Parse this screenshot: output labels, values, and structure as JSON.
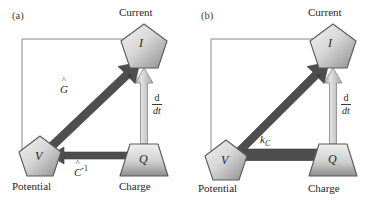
{
  "figure": {
    "type": "diagram",
    "background": "#ffffff",
    "node_fill_light": "#e8e8e8",
    "node_fill_dark": "#9a9a9a",
    "node_stroke": "#555555",
    "arrow_dark": "#4a4a4a",
    "arrow_light": "#bdbdbd",
    "thin_line": "#8a8a8a"
  },
  "panels": [
    {
      "id": "a",
      "label": "(a)",
      "nodes": [
        {
          "id": "current",
          "symbol": "I",
          "shape": "pentagon",
          "caption": "Current"
        },
        {
          "id": "potential",
          "symbol": "V",
          "shape": "pentagon",
          "caption": "Potential"
        },
        {
          "id": "charge",
          "symbol": "Q",
          "shape": "trapezoid",
          "caption": "Charge"
        }
      ],
      "edges": [
        {
          "id": "v-to-i",
          "from": "potential",
          "to": "current",
          "style": "thick-solid-arrow",
          "label_main": "G",
          "label_hat": "^",
          "label_sup": "",
          "label_text": "Ĝ"
        },
        {
          "id": "q-to-i",
          "from": "charge",
          "to": "current",
          "style": "outlined-arrow",
          "label_num": "d",
          "label_den": "dt",
          "label_text": "d/dt"
        },
        {
          "id": "q-to-v",
          "from": "charge",
          "to": "potential",
          "style": "thick-solid-arrow",
          "label_main": "C",
          "label_hat": "^",
          "label_sup": "-1",
          "label_text": "Ĉ⁻¹"
        },
        {
          "id": "i-to-v-feedback",
          "from": "current",
          "to": "potential",
          "style": "thin-line",
          "label_text": ""
        }
      ],
      "annotations": [
        {
          "id": "plus-sign",
          "text": "+"
        }
      ]
    },
    {
      "id": "b",
      "label": "(b)",
      "nodes": [
        {
          "id": "current",
          "symbol": "I",
          "shape": "pentagon",
          "caption": "Current"
        },
        {
          "id": "potential",
          "symbol": "V",
          "shape": "pentagon",
          "caption": "Potential"
        },
        {
          "id": "charge",
          "symbol": "Q",
          "shape": "trapezoid",
          "caption": "Charge"
        }
      ],
      "edges": [
        {
          "id": "q-to-i-curved",
          "from": "charge",
          "to": "current",
          "style": "thick-curved-arrow",
          "label_main": "k",
          "label_sub": "C",
          "label_text": "kC"
        },
        {
          "id": "q-to-i",
          "from": "charge",
          "to": "current",
          "style": "outlined-arrow",
          "label_num": "d",
          "label_den": "dt",
          "label_text": "d/dt"
        },
        {
          "id": "v-to-q",
          "from": "potential",
          "to": "charge",
          "style": "thin-line",
          "label_text": ""
        },
        {
          "id": "i-to-v-feedback",
          "from": "current",
          "to": "potential",
          "style": "thin-line",
          "label_text": ""
        }
      ],
      "annotations": [
        {
          "id": "plus-sign",
          "text": "+"
        }
      ]
    }
  ]
}
